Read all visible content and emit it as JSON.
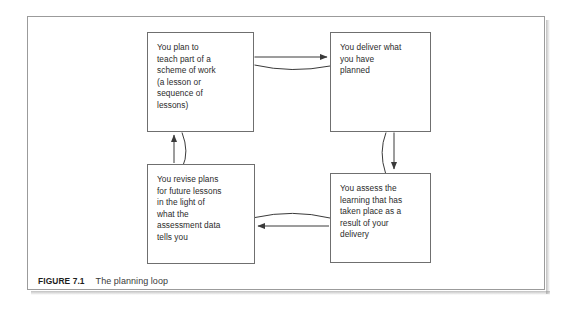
{
  "figure": {
    "caption_label": "FIGURE 7.1",
    "caption_text": "The planning loop",
    "frame_color": "#9b9b9b",
    "box_border_color": "#6f6f6f",
    "text_color": "#2b2b2b",
    "background": "#ffffff"
  },
  "diagram": {
    "type": "cycle-flowchart",
    "title": "The planning loop",
    "nodes": [
      {
        "id": "plan",
        "position": "top-left",
        "text": "You plan to\nteach part of a\nscheme of work\n(a lesson or\nsequence of\nlessons)"
      },
      {
        "id": "deliver",
        "position": "top-right",
        "text": "You deliver what\nyou have\nplanned"
      },
      {
        "id": "assess",
        "position": "bottom-right",
        "text": "You assess the\nlearning that has\ntaken place as a\nresult of your\ndelivery"
      },
      {
        "id": "revise",
        "position": "bottom-left",
        "text": "You revise plans\nfor future lessons\nin the light of\nwhat the\nassessment data\ntells you"
      }
    ],
    "edges": [
      {
        "id": "plan-to-deliver",
        "from": "plan",
        "to": "deliver",
        "direction": "right",
        "style": "straight-arrow-with-arc"
      },
      {
        "id": "deliver-to-assess",
        "from": "deliver",
        "to": "assess",
        "direction": "down",
        "style": "straight-arrow-with-arc"
      },
      {
        "id": "assess-to-revise",
        "from": "assess",
        "to": "revise",
        "direction": "left",
        "style": "straight-arrow-with-arc"
      },
      {
        "id": "revise-to-plan",
        "from": "revise",
        "to": "plan",
        "direction": "up",
        "style": "straight-arrow-with-arc"
      }
    ]
  }
}
